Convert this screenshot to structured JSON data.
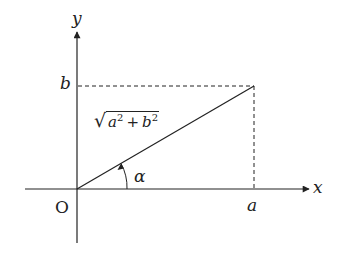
{
  "diagram": {
    "type": "coordinate-plane",
    "axes": {
      "x_label": "x",
      "y_label": "y",
      "origin_label": "O"
    },
    "point_labels": {
      "x_coord": "a",
      "y_coord": "b"
    },
    "segment_label": {
      "radicand_a": "a",
      "radicand_b": "b",
      "exponent": "2",
      "operator": "+"
    },
    "angle_label": "α",
    "colors": {
      "line": "#222222",
      "background": "#ffffff"
    }
  }
}
